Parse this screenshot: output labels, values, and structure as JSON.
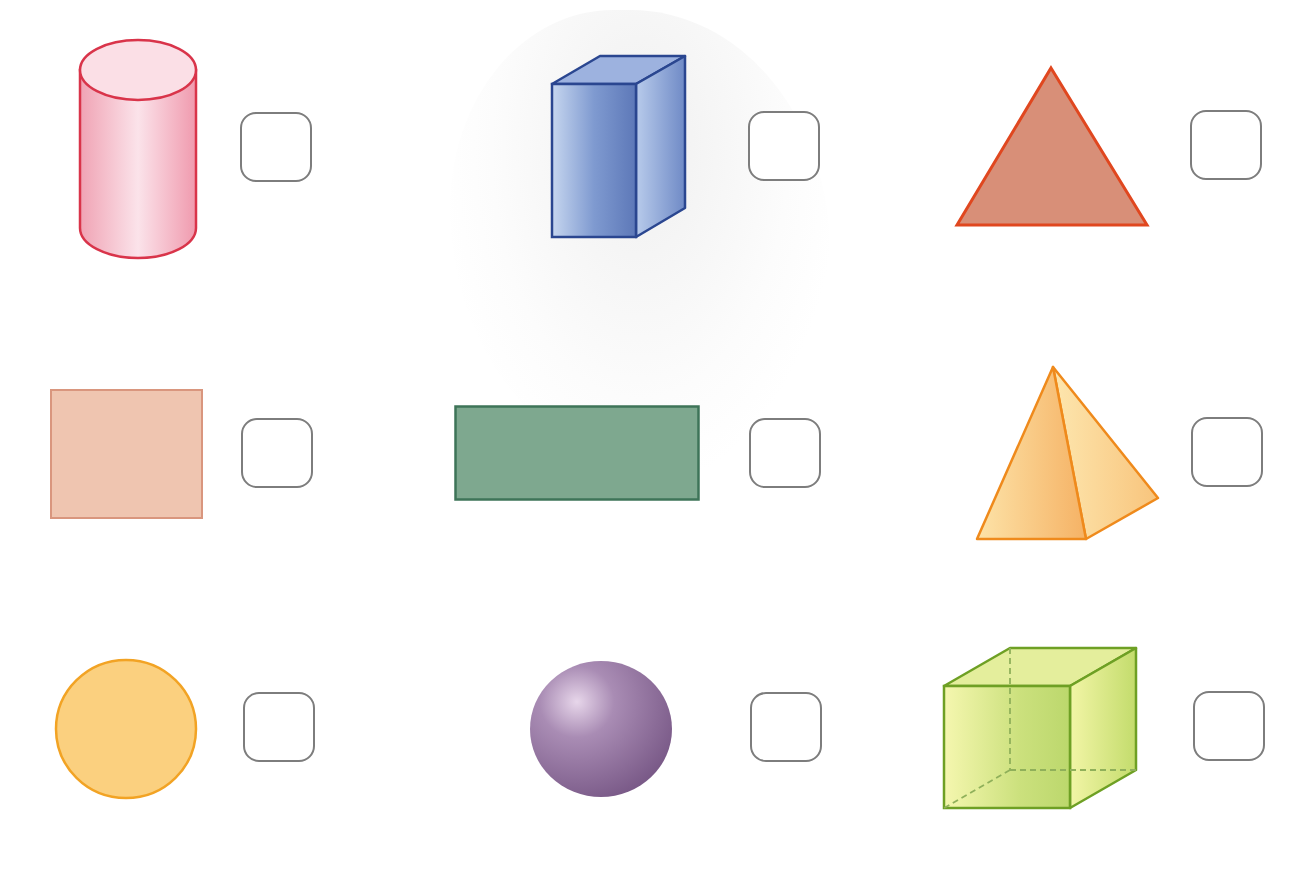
{
  "worksheet": {
    "items": [
      {
        "shape": "cylinder",
        "kind": "3D",
        "answer": "",
        "fill": "#f4b6c4",
        "stroke": "#d9344a"
      },
      {
        "shape": "rectangular-prism",
        "kind": "3D",
        "answer": "",
        "fill": "#8ea6d6",
        "stroke": "#2a4690"
      },
      {
        "shape": "triangle",
        "kind": "2D",
        "answer": "",
        "fill": "#d88f78",
        "stroke": "#e0471f"
      },
      {
        "shape": "square",
        "kind": "2D",
        "answer": "",
        "fill": "#efc5b0",
        "stroke": "#d9967e"
      },
      {
        "shape": "rectangle",
        "kind": "2D",
        "answer": "",
        "fill": "#7ea88f",
        "stroke": "#3e7458"
      },
      {
        "shape": "square-pyramid",
        "kind": "3D",
        "answer": "",
        "fill": "#f9c77d",
        "stroke": "#ef8a1c"
      },
      {
        "shape": "circle",
        "kind": "2D",
        "answer": "",
        "fill": "#fbd07f",
        "stroke": "#f2a324"
      },
      {
        "shape": "sphere",
        "kind": "3D",
        "answer": "",
        "fill": "#9c7fa8",
        "stroke": "#7a5a88"
      },
      {
        "shape": "cube",
        "kind": "3D",
        "answer": "",
        "fill": "#d9e88a",
        "stroke": "#6ea024"
      }
    ],
    "answer_box_border": "#7d7d7d"
  }
}
